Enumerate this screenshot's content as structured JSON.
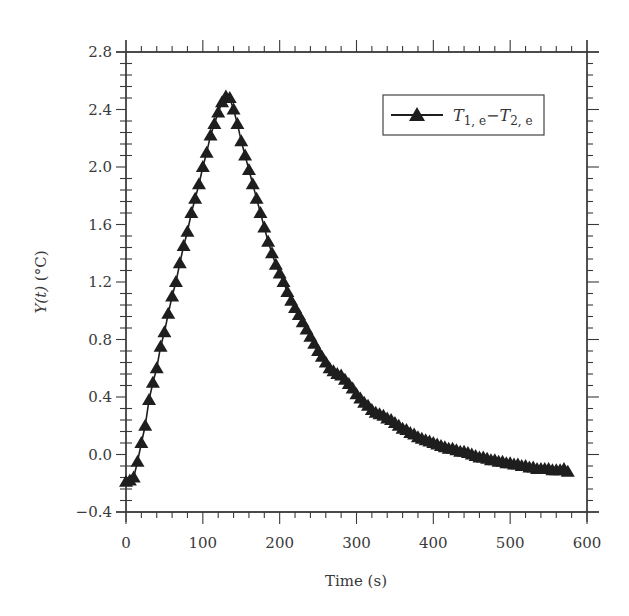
{
  "chart_data": {
    "type": "line",
    "title": "",
    "xlabel": "Time (s)",
    "ylabel_main": "Y(t)",
    "ylabel_unit": " (°C)",
    "xlim": [
      0,
      600
    ],
    "ylim": [
      -0.4,
      2.8
    ],
    "grid": false,
    "legend_position": "upper right",
    "x_ticks": [
      0,
      100,
      200,
      300,
      400,
      500,
      600
    ],
    "x_tick_labels": [
      "0",
      "100",
      "200",
      "300",
      "400",
      "500",
      "600"
    ],
    "y_ticks": [
      -0.4,
      0.0,
      0.4,
      0.8,
      1.2,
      1.6,
      2.0,
      2.4,
      2.8
    ],
    "y_tick_labels": [
      "−0.4",
      "0.0",
      "0.4",
      "0.8",
      "1.2",
      "1.6",
      "2.0",
      "2.4",
      "2.8"
    ],
    "series": [
      {
        "name": "T1,e − T2,e",
        "marker": "filled-triangle",
        "color": "#1e1e1e",
        "x": [
          0,
          5,
          10,
          15,
          20,
          25,
          30,
          35,
          40,
          45,
          50,
          55,
          60,
          65,
          70,
          75,
          80,
          85,
          90,
          95,
          100,
          105,
          110,
          115,
          120,
          125,
          130,
          135,
          140,
          145,
          150,
          155,
          160,
          165,
          170,
          175,
          180,
          185,
          190,
          195,
          200,
          205,
          210,
          215,
          220,
          225,
          230,
          235,
          240,
          245,
          250,
          255,
          260,
          265,
          270,
          275,
          280,
          285,
          290,
          295,
          300,
          305,
          310,
          315,
          320,
          325,
          330,
          335,
          340,
          345,
          350,
          355,
          360,
          365,
          370,
          375,
          380,
          385,
          390,
          395,
          400,
          405,
          410,
          415,
          420,
          425,
          430,
          435,
          440,
          445,
          450,
          455,
          460,
          465,
          470,
          475,
          480,
          485,
          490,
          495,
          500,
          505,
          510,
          515,
          520,
          525,
          530,
          535,
          540,
          545,
          550,
          555,
          560,
          565,
          570,
          575
        ],
        "y": [
          -0.19,
          -0.18,
          -0.16,
          -0.05,
          0.08,
          0.2,
          0.38,
          0.5,
          0.6,
          0.75,
          0.85,
          0.98,
          1.1,
          1.2,
          1.33,
          1.45,
          1.55,
          1.68,
          1.78,
          1.88,
          2.0,
          2.1,
          2.22,
          2.3,
          2.38,
          2.45,
          2.49,
          2.48,
          2.4,
          2.3,
          2.18,
          2.08,
          1.98,
          1.88,
          1.78,
          1.68,
          1.58,
          1.48,
          1.4,
          1.32,
          1.26,
          1.2,
          1.13,
          1.07,
          1.02,
          0.97,
          0.92,
          0.87,
          0.82,
          0.77,
          0.72,
          0.68,
          0.64,
          0.6,
          0.58,
          0.56,
          0.55,
          0.52,
          0.49,
          0.46,
          0.42,
          0.39,
          0.36,
          0.34,
          0.31,
          0.29,
          0.28,
          0.27,
          0.25,
          0.24,
          0.22,
          0.2,
          0.18,
          0.17,
          0.15,
          0.14,
          0.12,
          0.11,
          0.1,
          0.09,
          0.08,
          0.07,
          0.06,
          0.05,
          0.04,
          0.04,
          0.03,
          0.02,
          0.02,
          0.01,
          0.0,
          -0.01,
          -0.02,
          -0.02,
          -0.03,
          -0.04,
          -0.04,
          -0.05,
          -0.05,
          -0.06,
          -0.06,
          -0.07,
          -0.07,
          -0.08,
          -0.08,
          -0.09,
          -0.09,
          -0.1,
          -0.1,
          -0.1,
          -0.1,
          -0.11,
          -0.11,
          -0.11,
          -0.1,
          -0.12
        ]
      }
    ]
  },
  "legend": {
    "label_T": "T",
    "sub1": "1, e",
    "minus": "−",
    "label_T2": "T",
    "sub2": "2, e"
  },
  "axes": {
    "xlabel": "Time (s)",
    "ylabel_main": "Y(t)",
    "ylabel_unit": " (°C)"
  }
}
